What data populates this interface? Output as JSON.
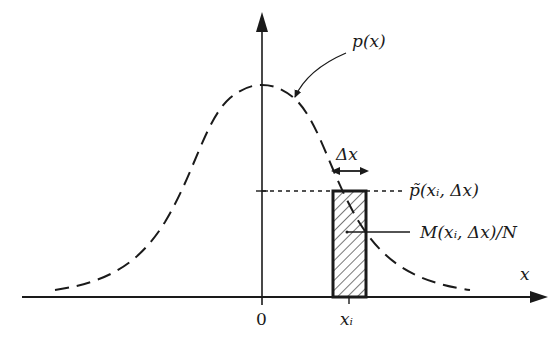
{
  "diagram": {
    "type": "probability-density-histogram-estimate",
    "curve_label": "p(x)",
    "delta_label": "Δx",
    "estimate_label": "p̃(xᵢ, Δx)",
    "bin_label": "M(xᵢ, Δx)/N",
    "x_axis_label": "x",
    "origin_label": "0",
    "bin_center_label": "xᵢ",
    "colors": {
      "ink": "#1a1a1a",
      "background": "#ffffff"
    }
  }
}
